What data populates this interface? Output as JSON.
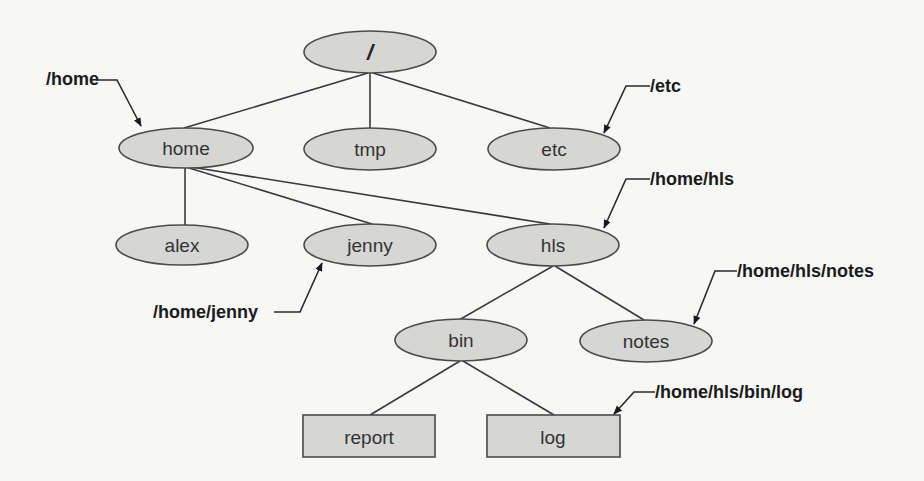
{
  "diagram": {
    "colors": {
      "node_fill": "#d6d6d4",
      "node_stroke": "#4a4a4a",
      "edge": "#3a3a3a",
      "background": "#f7f7f5"
    },
    "nodes": {
      "root": {
        "label": "/",
        "shape": "ellipse",
        "type": "directory"
      },
      "home": {
        "label": "home",
        "shape": "ellipse",
        "type": "directory"
      },
      "tmp": {
        "label": "tmp",
        "shape": "ellipse",
        "type": "directory"
      },
      "etc": {
        "label": "etc",
        "shape": "ellipse",
        "type": "directory"
      },
      "alex": {
        "label": "alex",
        "shape": "ellipse",
        "type": "directory"
      },
      "jenny": {
        "label": "jenny",
        "shape": "ellipse",
        "type": "directory"
      },
      "hls": {
        "label": "hls",
        "shape": "ellipse",
        "type": "directory"
      },
      "bin": {
        "label": "bin",
        "shape": "ellipse",
        "type": "directory"
      },
      "notes": {
        "label": "notes",
        "shape": "ellipse",
        "type": "directory"
      },
      "report": {
        "label": "report",
        "shape": "rectangle",
        "type": "file"
      },
      "log": {
        "label": "log",
        "shape": "rectangle",
        "type": "file"
      }
    },
    "edges": [
      {
        "from": "/",
        "to": "home"
      },
      {
        "from": "/",
        "to": "tmp"
      },
      {
        "from": "/",
        "to": "etc"
      },
      {
        "from": "home",
        "to": "alex"
      },
      {
        "from": "home",
        "to": "jenny"
      },
      {
        "from": "home",
        "to": "hls"
      },
      {
        "from": "hls",
        "to": "bin"
      },
      {
        "from": "hls",
        "to": "notes"
      },
      {
        "from": "bin",
        "to": "report"
      },
      {
        "from": "bin",
        "to": "log"
      }
    ],
    "annotations": {
      "home": {
        "text": "/home",
        "points_to": "home"
      },
      "etc": {
        "text": "/etc",
        "points_to": "etc"
      },
      "hls": {
        "text": "/home/hls",
        "points_to": "hls"
      },
      "jenny": {
        "text": "/home/jenny",
        "points_to": "jenny"
      },
      "notes": {
        "text": "/home/hls/notes",
        "points_to": "notes"
      },
      "log": {
        "text": "/home/hls/bin/log",
        "points_to": "log"
      }
    }
  }
}
